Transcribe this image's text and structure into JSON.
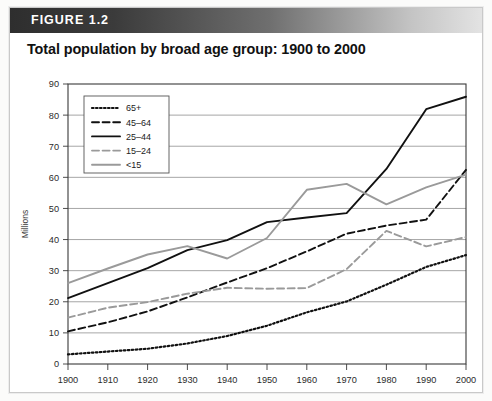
{
  "figure": {
    "label": "FIGURE 1.2",
    "title": "Total population by broad age group: 1900 to 2000"
  },
  "chart_data": {
    "type": "line",
    "title": "Total population by broad age group: 1900 to 2000",
    "xlabel": "",
    "ylabel": "Millions",
    "x": [
      1900,
      1910,
      1920,
      1930,
      1940,
      1950,
      1960,
      1970,
      1980,
      1990,
      2000
    ],
    "xlim": [
      1900,
      2000
    ],
    "ylim": [
      0,
      90
    ],
    "yticks": [
      0,
      10,
      20,
      30,
      40,
      50,
      60,
      70,
      80,
      90
    ],
    "xticks": [
      "1900",
      "1910",
      "1920",
      "1930",
      "1940",
      "1950",
      "1960",
      "1970",
      "1980",
      "1990",
      "2000"
    ],
    "grid": "horizontal",
    "legend_position": "upper-left-inside",
    "series": [
      {
        "name": "65+",
        "style": "dotted",
        "color": "#111111",
        "values": [
          3.1,
          4.0,
          4.9,
          6.6,
          9.0,
          12.3,
          16.6,
          20.1,
          25.5,
          31.2,
          35.0
        ]
      },
      {
        "name": "45–64",
        "style": "dashed",
        "color": "#111111",
        "values": [
          10.5,
          13.4,
          16.9,
          21.4,
          26.2,
          30.8,
          36.2,
          41.9,
          44.5,
          46.4,
          62.4
        ]
      },
      {
        "name": "25–44",
        "style": "solid",
        "color": "#111111",
        "values": [
          21.2,
          26.0,
          30.8,
          36.6,
          39.8,
          45.6,
          47.1,
          48.5,
          62.7,
          81.9,
          85.9
        ]
      },
      {
        "name": "15–24",
        "style": "dashed",
        "color": "#9a9a9a",
        "values": [
          14.9,
          18.1,
          19.9,
          22.6,
          24.5,
          24.2,
          24.4,
          30.5,
          42.8,
          37.8,
          40.8
        ]
      },
      {
        "name": "<15",
        "style": "solid",
        "color": "#9a9a9a",
        "values": [
          26.0,
          30.7,
          35.2,
          37.9,
          33.9,
          40.5,
          56.0,
          57.9,
          51.3,
          56.8,
          60.9
        ]
      }
    ]
  }
}
